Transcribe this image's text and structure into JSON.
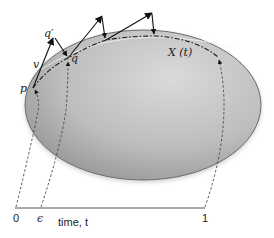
{
  "diagram": {
    "type": "flow-on-manifold",
    "manifold": {
      "shape": "ellipse",
      "fill_light": "#d9d9d9",
      "fill_dark": "#8f8f8f",
      "outline": "#6b6b6b"
    },
    "labels": {
      "p": "p",
      "q": "q",
      "q_prime": "q′",
      "v": "v",
      "curve": "X (t)"
    },
    "points": [
      {
        "id": "p",
        "label": "p"
      },
      {
        "id": "q",
        "label": "q"
      },
      {
        "id": "q_prime",
        "label": "q′"
      }
    ],
    "vectors": [
      {
        "id": "v",
        "from": "p",
        "to": "q_prime",
        "label": "v"
      }
    ],
    "timeline": {
      "label": "time, t",
      "ticks": [
        {
          "label": "0",
          "maps_to": "p"
        },
        {
          "label": "ϵ",
          "maps_to": "q"
        },
        {
          "label": "1",
          "maps_to": "X(1)"
        }
      ]
    },
    "colors": {
      "ink": "#1a1a1a",
      "dashed": "#444444",
      "background": "#ffffff"
    }
  }
}
